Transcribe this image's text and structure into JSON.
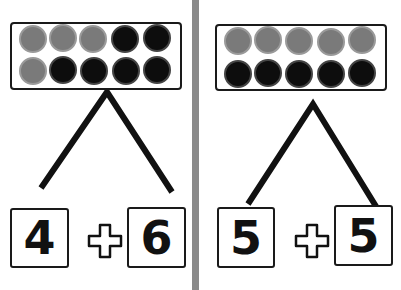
{
  "colors": {
    "gray_counter": "#7a7a7a",
    "black_counter": "#0d0d0d",
    "divider": "#8a8a8a",
    "outline": "#1a1a1a"
  },
  "panels": [
    {
      "ten_frame": {
        "top_row": [
          "gray",
          "gray",
          "gray",
          "black",
          "black"
        ],
        "bottom_row": [
          "gray",
          "black",
          "black",
          "black",
          "black"
        ]
      },
      "left_number": "4",
      "operator": "plus-icon",
      "right_number": "6"
    },
    {
      "ten_frame": {
        "top_row": [
          "gray",
          "gray",
          "gray",
          "gray",
          "gray"
        ],
        "bottom_row": [
          "black",
          "black",
          "black",
          "black",
          "black"
        ]
      },
      "left_number": "5",
      "operator": "plus-icon",
      "right_number": "5"
    }
  ]
}
